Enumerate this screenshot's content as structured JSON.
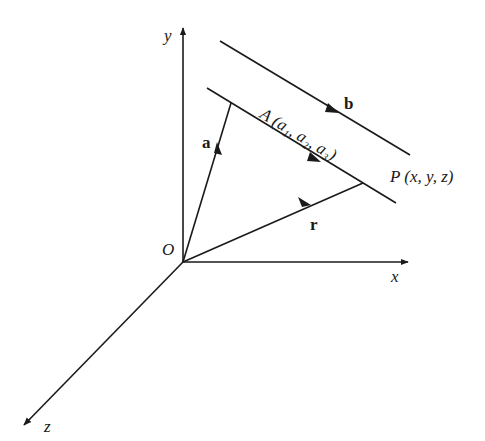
{
  "diagram": {
    "colors": {
      "stroke": "#1a1a1a",
      "background": "#ffffff"
    },
    "origin": {
      "label": "O"
    },
    "axes": [
      {
        "name": "x",
        "label": "x"
      },
      {
        "name": "y",
        "label": "y"
      },
      {
        "name": "z",
        "label": "z"
      }
    ],
    "vectors": [
      {
        "name": "a",
        "label": "a",
        "from": "O",
        "to": "A"
      },
      {
        "name": "r",
        "label": "r",
        "from": "O",
        "to": "P"
      },
      {
        "name": "b",
        "label": "b",
        "direction": "parallel to line"
      }
    ],
    "points": {
      "A": {
        "label": "A",
        "coords_text": "(a₁, a₂, a₃)"
      },
      "P": {
        "label": "P",
        "coords_text": "(x, y, z)"
      }
    },
    "lines": [
      {
        "name": "line-through-A-and-P"
      },
      {
        "name": "line-b-direction"
      }
    ]
  }
}
